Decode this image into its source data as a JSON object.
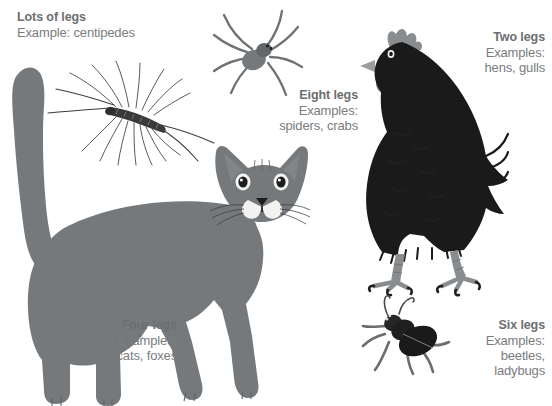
{
  "poster": {
    "title": "How many legs?",
    "background_color": "#ffffff",
    "text_color": "#76787a",
    "animal_gray": "#76797b",
    "animal_black": "#1a1a1a",
    "width": 552,
    "height": 406
  },
  "labels": {
    "lots": {
      "heading": "Lots of legs",
      "line1": "Example: centipedes",
      "align": "left"
    },
    "eight": {
      "heading": "Eight legs",
      "line1": "Examples:",
      "line2": "spiders, crabs",
      "align": "right"
    },
    "two": {
      "heading": "Two legs",
      "line1": "Examples:",
      "line2": "hens, gulls",
      "align": "right"
    },
    "four": {
      "heading": "Four legs",
      "line1": "Examples:",
      "line2": "cats, foxes",
      "align": "right"
    },
    "six": {
      "heading": "Six legs",
      "line1": "Examples:",
      "line2": "beetles,",
      "line3": "ladybugs",
      "align": "right"
    }
  },
  "illustrations": {
    "centipede": {
      "name": "centipede",
      "legs": "many",
      "color": "#3a3a3a"
    },
    "spider": {
      "name": "spider",
      "legs": "8",
      "color": "#6f7274"
    },
    "hen": {
      "name": "hen",
      "legs": "2",
      "color": "#1a1a1a",
      "accent_color": "#8a8d8f"
    },
    "cat": {
      "name": "cat",
      "legs": "4",
      "color": "#76797b"
    },
    "beetle": {
      "name": "beetle",
      "legs": "6",
      "color": "#262626"
    }
  }
}
